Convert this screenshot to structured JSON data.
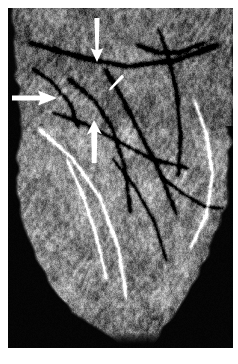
{
  "figure": {
    "modality": "cardiac-ct-volume-rendering",
    "title": "",
    "caption": "",
    "background_color": "#ffffff",
    "plate_color": "#050505",
    "annotation_color": "#ffffff"
  },
  "image": {
    "name": "volume-rendered-heart",
    "description": "Grayscale three-dimensional volume-rendered cardiac CT angiogram of the heart viewed from the anterior-left oblique projection, showing the myocardial surface with epicardial coronary arteries coursing over it.",
    "grayscale": true,
    "width": 225,
    "height": 340
  },
  "annotations": {
    "items": [
      {
        "id": "arrow-superior",
        "label": "",
        "type": "arrow",
        "direction": "down",
        "color": "#ffffff",
        "size": "large",
        "tail": {
          "x": 89,
          "y": 10
        },
        "tip": {
          "x": 89,
          "y": 54
        }
      },
      {
        "id": "arrow-lateral-left",
        "label": "",
        "type": "arrow",
        "direction": "right",
        "color": "#ffffff",
        "size": "large",
        "tail": {
          "x": 4,
          "y": 90
        },
        "tip": {
          "x": 49,
          "y": 90
        }
      },
      {
        "id": "arrow-inferior",
        "label": "",
        "type": "arrow",
        "direction": "up",
        "color": "#ffffff",
        "size": "large",
        "tail": {
          "x": 86,
          "y": 155
        },
        "tip": {
          "x": 86,
          "y": 112
        }
      },
      {
        "id": "arrowhead-small-central",
        "label": "",
        "type": "arrowhead",
        "direction": "down-left",
        "color": "#ffffff",
        "size": "small",
        "tail": {
          "x": 114,
          "y": 68
        },
        "tip": {
          "x": 101,
          "y": 82
        }
      }
    ],
    "count_label": "4"
  },
  "chart_data": {
    "type": "heatmap",
    "title": "",
    "xlabel": "",
    "ylabel": "",
    "grid": false,
    "legend": "none",
    "colormap": "grayscale",
    "xlim": [
      0,
      225
    ],
    "ylim": [
      0,
      340
    ]
  }
}
